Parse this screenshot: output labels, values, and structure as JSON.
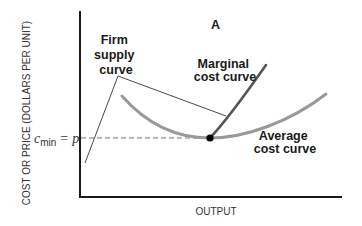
{
  "panel_label": "A",
  "axes": {
    "y_label": "COST OR PRICE (DOLLARS PER UNIT)",
    "x_label": "OUTPUT"
  },
  "price_label": {
    "c": "c",
    "sub": "min",
    "eq": "= p"
  },
  "curves": {
    "firm_supply": [
      "Firm",
      "supply",
      "curve"
    ],
    "marginal_cost": [
      "Marginal",
      "cost curve"
    ],
    "average_cost": [
      "Average",
      "cost curve"
    ]
  },
  "colors": {
    "axis": "#1a1a1a",
    "marginal_cost": "#555555",
    "average_cost": "#999999",
    "leader": "#333333",
    "dashed": "#777777"
  }
}
